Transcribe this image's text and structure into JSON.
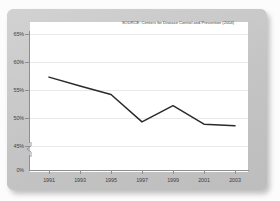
{
  "figure": {
    "source_note": "SOURCE: Centers for Disease Control and Prevention (2004)",
    "panel_color": "#c9c9c9",
    "plot_background": "#ffffff",
    "line_color": "#2a2a2a",
    "grid_color": "#e9e9ec",
    "axis_color": "#8f8f93"
  },
  "chart_data": {
    "type": "line",
    "title": "",
    "subtitle": "",
    "xlabel": "",
    "ylabel": "",
    "annotations": [
      "SOURCE: Centers for Disease Control and Prevention (2004)"
    ],
    "grid": true,
    "legend": "none",
    "axis_break": true,
    "x": [
      1991,
      1993,
      1995,
      1997,
      1999,
      2001,
      2003
    ],
    "categories": [
      "1991",
      "1993",
      "1995",
      "1997",
      "1999",
      "2001",
      "2003"
    ],
    "values": [
      57.3,
      55.7,
      54.2,
      49.3,
      52.2,
      48.9,
      48.6
    ],
    "series": [
      {
        "name": "percent",
        "values": [
          57.3,
          55.7,
          54.2,
          49.3,
          52.2,
          48.9,
          48.6
        ]
      }
    ],
    "ylim": [
      45,
      65
    ],
    "yticks": [
      45,
      50,
      55,
      60,
      65
    ],
    "ytick_labels": [
      "45%",
      "50%",
      "55%",
      "60%",
      "65%"
    ],
    "ytick_extra_label": "0%",
    "xlim": [
      1990,
      2004
    ],
    "xticks": [
      1991,
      1993,
      1995,
      1997,
      1999,
      2001,
      2003
    ],
    "xtick_labels": [
      "1991",
      "1993",
      "1995",
      "1997",
      "1999",
      "2001",
      "2003"
    ]
  }
}
